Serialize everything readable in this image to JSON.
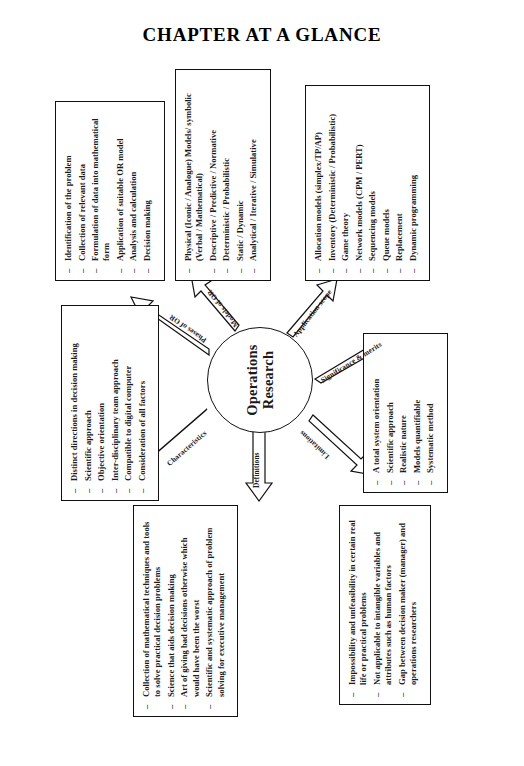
{
  "page": {
    "title": "CHAPTER AT A GLANCE"
  },
  "hub": {
    "line1": "Operations",
    "line2": "Research"
  },
  "arrows": [
    {
      "id": "characteristics",
      "label": "Characteristics"
    },
    {
      "id": "phases",
      "label": "Phases of OR"
    },
    {
      "id": "models",
      "label": "Models of OR"
    },
    {
      "id": "application",
      "label": "Application scope"
    },
    {
      "id": "significance",
      "label": "Significance & merits"
    },
    {
      "id": "limitations",
      "label": "Limitations"
    },
    {
      "id": "definitions",
      "label": "Definitions"
    }
  ],
  "boxes": {
    "characteristics": {
      "name": "Characteristics",
      "items": [
        "Distinct directions in decision making",
        "Scientific approach",
        "Objective orientation",
        "Inter-disciplinary team approach",
        "Compatible to digital computer",
        "Consideration of all factors"
      ]
    },
    "phases": {
      "name": "Phases of OR",
      "items": [
        "Identification of the problem",
        "Collection of relevant data",
        "Formulation of data into mathematical form",
        "Application of suitable OR model",
        "Analysis and calculation",
        "Decision making"
      ]
    },
    "models": {
      "name": "Models of OR",
      "items": [
        "Physical (Iconic / Analogue) Models/ symbolic (Verbal / Mathematical)",
        "Descriptive / Predictive / Normative",
        "Deterministic / Probabilistic",
        "Static / Dynamic",
        "Analytical / Iterative / Simulative"
      ]
    },
    "scope": {
      "name": "Application scope",
      "items": [
        "Allocation models (simplex/TP/AP)",
        "Inventory (Deterministic / Probabilistic)",
        "Game theory",
        "Network models (CPM / PERT)",
        "Sequencing models",
        "Queue models",
        "Replacement",
        "Dynamic programming"
      ]
    },
    "significance": {
      "name": "Significance & merits",
      "items": [
        "A total system orientation",
        "Scientific approach",
        "Realistic nature",
        "Models quantifiable",
        "Systematic method"
      ]
    },
    "limitations": {
      "name": "Limitations",
      "items": [
        "Impossibility and unfeasibility in certain real life or practical problems",
        "Not applicable to intangible variables and attributes such as human factors",
        "Gap between decision maker (manager) and operations researchers"
      ]
    },
    "definitions": {
      "name": "Definitions",
      "items": [
        "Collection of mathematical techniques and tools to solve practical decision problems",
        "Science that aids decision making",
        "Art of giving bad decisions otherwise which would have been the worst",
        "Scientific and systematic approach of problem solving for executive management"
      ]
    }
  },
  "colors": {
    "ink": "#111111",
    "paper": "#ffffff"
  }
}
